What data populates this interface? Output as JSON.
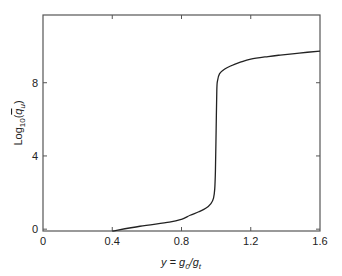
{
  "chart_data": {
    "type": "line",
    "title": "",
    "xlabel": "y = g0/gt",
    "xlabel_parts": {
      "main": "y = g",
      "sub1": "0",
      "mid": "/g",
      "sub2": "t"
    },
    "ylabel": "Log10(q̄u)",
    "ylabel_parts": {
      "pre": "Log",
      "sub1": "10",
      "open": "(",
      "q": "q",
      "sub2": "u",
      "close": ")"
    },
    "xlim": [
      0,
      1.6
    ],
    "ylim": [
      -0.1,
      11.7
    ],
    "xticks": [
      0,
      0.4,
      0.8,
      1.2,
      1.6
    ],
    "xtick_labels": [
      "0",
      "0.4",
      "0.8",
      "1.2",
      "1.6"
    ],
    "yticks": [
      0,
      4,
      8
    ],
    "ytick_labels": [
      "0",
      "4",
      "8"
    ],
    "grid": false,
    "legend": null,
    "series": [
      {
        "name": "Log10(q̄u)",
        "color": "#222222",
        "x": [
          0.4,
          0.56,
          0.73,
          0.8,
          0.85,
          0.9,
          0.94,
          0.97,
          0.985,
          0.992,
          0.996,
          1.0,
          1.004,
          1.008,
          1.02,
          1.05,
          1.08,
          1.14,
          1.2,
          1.3,
          1.37,
          1.48,
          1.6
        ],
        "y": [
          -0.11,
          0.16,
          0.38,
          0.54,
          0.76,
          0.95,
          1.14,
          1.4,
          1.7,
          2.2,
          3.2,
          5.4,
          7.6,
          8.1,
          8.5,
          8.75,
          8.9,
          9.12,
          9.29,
          9.43,
          9.51,
          9.62,
          9.73
        ]
      }
    ]
  }
}
